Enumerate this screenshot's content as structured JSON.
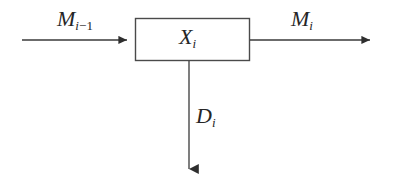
{
  "diagram": {
    "type": "block-flow-diagram",
    "background_color": "#ffffff",
    "stroke_color": "#3a3a3a",
    "text_color": "#262626",
    "block": {
      "name": "process-block",
      "label_base": "X",
      "label_sub": "i",
      "x": 135,
      "y": 18,
      "width": 115,
      "height": 43,
      "fill": "#ffffff"
    },
    "arrows": [
      {
        "name": "input-arrow",
        "direction": "right",
        "from_x": 22,
        "from_y": 40,
        "to_x": 135,
        "to_y": 40,
        "label_base": "M",
        "label_sub_var": "i",
        "label_sub_op": "−",
        "label_sub_num": "1"
      },
      {
        "name": "output-arrow",
        "direction": "right",
        "from_x": 250,
        "from_y": 40,
        "to_x": 379,
        "to_y": 40,
        "label_base": "M",
        "label_sub_var": "i"
      },
      {
        "name": "demand-arrow",
        "direction": "down",
        "from_x": 189,
        "from_y": 61,
        "to_x": 189,
        "to_y": 180,
        "label_base": "D",
        "label_sub_var": "i"
      }
    ]
  },
  "labels": {
    "input": {
      "base": "M",
      "sub_var": "i",
      "sub_op": "−",
      "sub_num": "1"
    },
    "block": {
      "base": "X",
      "sub_var": "i"
    },
    "output": {
      "base": "M",
      "sub_var": "i"
    },
    "down": {
      "base": "D",
      "sub_var": "i"
    }
  }
}
